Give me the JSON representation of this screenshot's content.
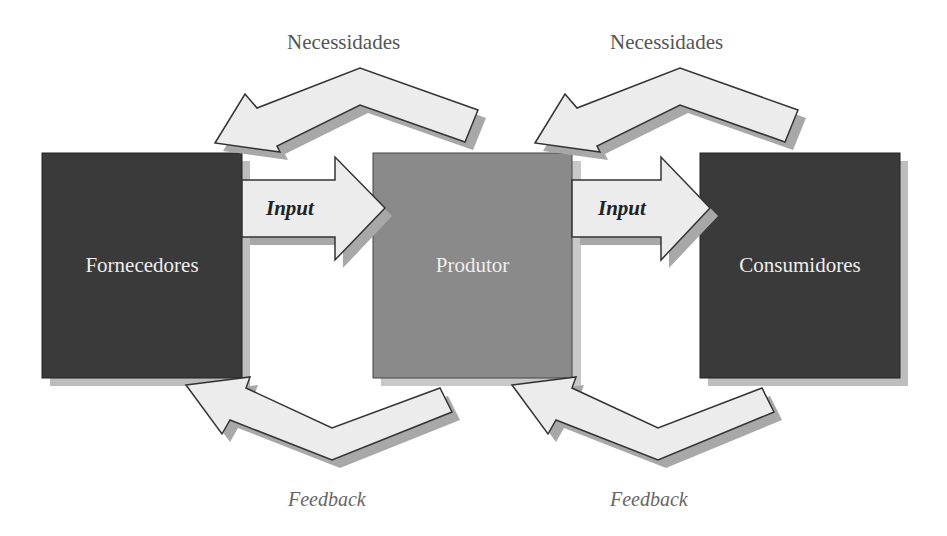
{
  "diagram": {
    "nodes": [
      {
        "id": "fornecedores",
        "label": "Fornecedores",
        "color": "#3a3a3a"
      },
      {
        "id": "produtor",
        "label": "Produtor",
        "color": "#8a8a8a"
      },
      {
        "id": "consumidores",
        "label": "Consumidores",
        "color": "#3a3a3a"
      }
    ],
    "edges": [
      {
        "from": "fornecedores",
        "to": "produtor",
        "label": "Input"
      },
      {
        "from": "produtor",
        "to": "consumidores",
        "label": "Input"
      },
      {
        "from": "produtor",
        "to": "fornecedores",
        "label": "Necessidades"
      },
      {
        "from": "consumidores",
        "to": "produtor",
        "label": "Necessidades"
      },
      {
        "from": "produtor",
        "to": "fornecedores",
        "label": "Feedback"
      },
      {
        "from": "consumidores",
        "to": "produtor",
        "label": "Feedback"
      }
    ]
  },
  "labels": {
    "necessidades_1": "Necessidades",
    "necessidades_2": "Necessidades",
    "input_1": "Input",
    "input_2": "Input",
    "feedback_1": "Feedback",
    "feedback_2": "Feedback",
    "box_1": "Fornecedores",
    "box_2": "Produtor",
    "box_3": "Consumidores"
  },
  "colors": {
    "dark_box": "#3a3a3a",
    "mid_box": "#8a8a8a",
    "arrow_fill": "#ececec",
    "arrow_stroke": "#333333",
    "shadow": "#a8a8a8"
  }
}
